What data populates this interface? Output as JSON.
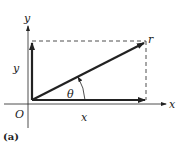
{
  "figure": {
    "caption": "(a)",
    "labels": {
      "x_axis": "x",
      "y_axis": "y",
      "origin": "O",
      "x_component": "x",
      "y_component": "y",
      "vector": "r",
      "angle": "θ"
    },
    "colors": {
      "stroke": "#222222",
      "background": "#ffffff"
    }
  }
}
